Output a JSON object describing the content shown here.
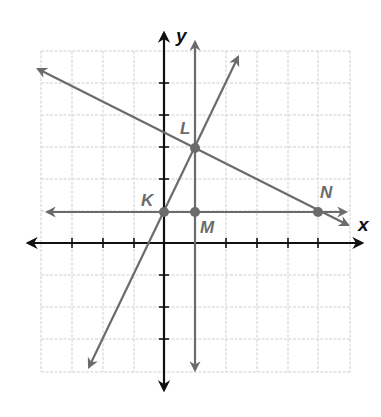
{
  "diagram": {
    "type": "coordinate-plane",
    "axes": {
      "x_label": "x",
      "y_label": "y",
      "x_range": [
        -4,
        6
      ],
      "y_range": [
        -4,
        6
      ]
    },
    "colors": {
      "axis": "#1a1a1a",
      "line": "#6b6b6b",
      "grid": "#cfcfcf",
      "point": "#6b6b6b",
      "label": "#6b6b6b"
    },
    "points": [
      {
        "label": "K",
        "x": 0,
        "y": 1
      },
      {
        "label": "L",
        "x": 1,
        "y": 3
      },
      {
        "label": "M",
        "x": 1,
        "y": 1
      },
      {
        "label": "N",
        "x": 5,
        "y": 1
      }
    ],
    "lines": [
      {
        "name": "line-KL",
        "through": [
          "K",
          "L"
        ],
        "slope": 2
      },
      {
        "name": "line-LN",
        "through": [
          "L",
          "N"
        ],
        "slope": -0.5
      },
      {
        "name": "line-KN",
        "through": [
          "K",
          "M",
          "N"
        ],
        "slope": 0
      },
      {
        "name": "line-LM",
        "through": [
          "L",
          "M"
        ],
        "slope": "undefined"
      }
    ]
  }
}
